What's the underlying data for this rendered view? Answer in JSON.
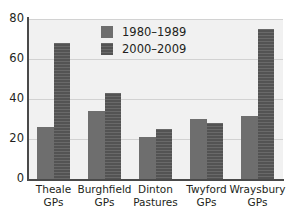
{
  "chart_data": {
    "type": "bar",
    "title": "",
    "subtitle": "",
    "xlabel": "",
    "ylabel": "",
    "ylim": [
      0,
      80
    ],
    "y_ticks": [
      0,
      20,
      40,
      60,
      80
    ],
    "grid": true,
    "legend_position": "top-center",
    "categories": [
      "Theale GPs",
      "Burghfield GPs",
      "Dinton Pastures",
      "Twyford GPs",
      "Wraysbury GPs"
    ],
    "category_lines": [
      [
        "Theale",
        "GPs"
      ],
      [
        "Burghfield",
        "GPs"
      ],
      [
        "Dinton",
        "Pastures"
      ],
      [
        "Twyford",
        "GPs"
      ],
      [
        "Wraysbury",
        "GPs"
      ]
    ],
    "series": [
      {
        "name": "1980–1989",
        "color": "#6e6e6e",
        "values": [
          26,
          34,
          21,
          30,
          31.5
        ]
      },
      {
        "name": "2000–2009",
        "color": "#585858",
        "values": [
          68,
          43,
          25,
          28,
          75
        ]
      }
    ]
  },
  "legend": {
    "entries": [
      {
        "label": "1980–1989"
      },
      {
        "label": "2000–2009"
      }
    ]
  },
  "axis": {
    "y_tick_labels": [
      "80",
      "60",
      "40",
      "20",
      "0"
    ]
  },
  "colors": {
    "plot_background": "#f1f1f1",
    "axis_line": "#4a4a4a",
    "gridline": "#d2d2d2",
    "series_1980": "#6e6e6e",
    "series_2000": "#585858",
    "text": "#231f20",
    "page_background": "#ffffff"
  }
}
